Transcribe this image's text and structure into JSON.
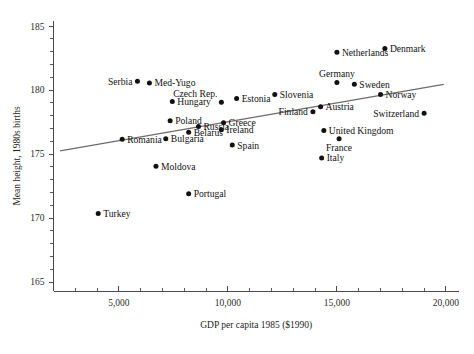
{
  "chart_data": {
    "type": "scatter",
    "title": "",
    "xlabel": "GDP per capita 1985 ($1990)",
    "ylabel": "Mean height, 1980s births",
    "xlim": [
      2000,
      20600
    ],
    "ylim": [
      164.3,
      185.4
    ],
    "grid": false,
    "legend": "none",
    "x_ticks": [
      {
        "value": 5000,
        "label": "5,000"
      },
      {
        "value": 10000,
        "label": "10,000"
      },
      {
        "value": 15000,
        "label": "15,000"
      },
      {
        "value": 20000,
        "label": "20,000"
      }
    ],
    "x_minor_tick_step": 1000,
    "y_ticks": [
      {
        "value": 165,
        "label": "165"
      },
      {
        "value": 170,
        "label": "170"
      },
      {
        "value": 175,
        "label": "175"
      },
      {
        "value": 180,
        "label": "180"
      },
      {
        "value": 185,
        "label": "185"
      }
    ],
    "y_minor_tick_step": 1,
    "trend_line": {
      "type": "linear-fit",
      "x_start": 2300,
      "y_start": 175.25,
      "x_end": 19900,
      "y_end": 180.45
    },
    "points": [
      {
        "label": "Serbia",
        "x": 5850,
        "y": 180.7,
        "label_pos": "left"
      },
      {
        "label": "Med-Yugo",
        "x": 6400,
        "y": 180.55,
        "label_pos": "right"
      },
      {
        "label": "Hungary",
        "x": 7450,
        "y": 179.1,
        "label_pos": "right"
      },
      {
        "label": "Czech Rep.",
        "x": 9700,
        "y": 179.05,
        "label_pos": "above-left"
      },
      {
        "label": "Estonia",
        "x": 10400,
        "y": 179.35,
        "label_pos": "right"
      },
      {
        "label": "Slovenia",
        "x": 12150,
        "y": 179.65,
        "label_pos": "right"
      },
      {
        "label": "Germany",
        "x": 15000,
        "y": 180.6,
        "label_pos": "above"
      },
      {
        "label": "Sweden",
        "x": 15800,
        "y": 180.45,
        "label_pos": "right"
      },
      {
        "label": "Netherlands",
        "x": 15000,
        "y": 182.95,
        "label_pos": "right"
      },
      {
        "label": "Denmark",
        "x": 17200,
        "y": 183.25,
        "label_pos": "right"
      },
      {
        "label": "Norway",
        "x": 17000,
        "y": 179.65,
        "label_pos": "right"
      },
      {
        "label": "Switzerland",
        "x": 19000,
        "y": 178.2,
        "label_pos": "left"
      },
      {
        "label": "Austria",
        "x": 14250,
        "y": 178.7,
        "label_pos": "right"
      },
      {
        "label": "Finland",
        "x": 13900,
        "y": 178.3,
        "label_pos": "left"
      },
      {
        "label": "United Kingdom",
        "x": 14400,
        "y": 176.85,
        "label_pos": "right"
      },
      {
        "label": "France",
        "x": 15100,
        "y": 176.2,
        "label_pos": "below"
      },
      {
        "label": "Italy",
        "x": 14300,
        "y": 174.7,
        "label_pos": "right"
      },
      {
        "label": "Greece",
        "x": 9800,
        "y": 177.45,
        "label_pos": "right"
      },
      {
        "label": "Ireland",
        "x": 9700,
        "y": 176.9,
        "label_pos": "right"
      },
      {
        "label": "Spain",
        "x": 10200,
        "y": 175.7,
        "label_pos": "right"
      },
      {
        "label": "Poland",
        "x": 7350,
        "y": 177.6,
        "label_pos": "right"
      },
      {
        "label": "Russia",
        "x": 8650,
        "y": 177.15,
        "label_pos": "right"
      },
      {
        "label": "Belarus",
        "x": 8200,
        "y": 176.7,
        "label_pos": "right"
      },
      {
        "label": "Bulgaria",
        "x": 7150,
        "y": 176.2,
        "label_pos": "right"
      },
      {
        "label": "Romania",
        "x": 5150,
        "y": 176.15,
        "label_pos": "right"
      },
      {
        "label": "Moldova",
        "x": 6700,
        "y": 174.05,
        "label_pos": "right"
      },
      {
        "label": "Portugal",
        "x": 8200,
        "y": 171.9,
        "label_pos": "right"
      },
      {
        "label": "Turkey",
        "x": 4050,
        "y": 170.35,
        "label_pos": "right"
      }
    ]
  }
}
